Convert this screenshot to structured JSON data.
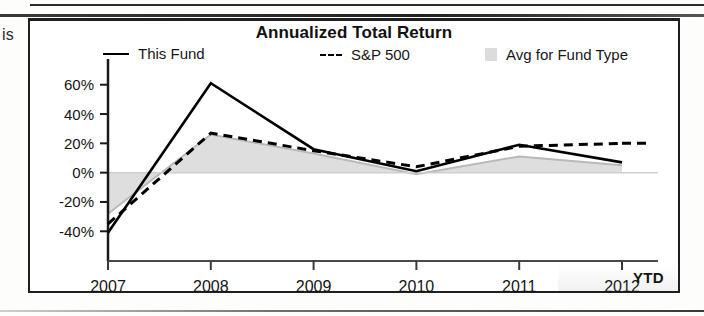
{
  "page": {
    "left_fragment_text": "is"
  },
  "chart": {
    "title": "Annualized Total Return",
    "legend": [
      {
        "key": "fund",
        "label": "This Fund",
        "marker": "solid-line",
        "color": "#000000"
      },
      {
        "key": "sp",
        "label": "S&P 500",
        "marker": "dashed-line",
        "color": "#000000"
      },
      {
        "key": "avg",
        "label": "Avg for Fund Type",
        "marker": "filled-area",
        "color": "#dcdcdc"
      }
    ],
    "axis_suffix_label": "YTD"
  },
  "chart_data": {
    "type": "line",
    "title": "Annualized Total Return",
    "xlabel": "",
    "ylabel": "",
    "categories": [
      "2007",
      "2008",
      "2009",
      "2010",
      "2011",
      "2012"
    ],
    "x_tick_labels": [
      "2007",
      "2008",
      "2009",
      "2010",
      "2011",
      "2012"
    ],
    "x_axis_note": "YTD",
    "y_tick_labels": [
      "60%",
      "40%",
      "20%",
      "0%",
      "-20%",
      "-40%"
    ],
    "y_ticks": [
      60,
      40,
      20,
      0,
      -20,
      -40
    ],
    "ylim": [
      -48,
      68
    ],
    "y_unit": "%",
    "grid": false,
    "legend_position": "top",
    "series": [
      {
        "name": "This Fund",
        "style": "solid",
        "color": "#000000",
        "values": [
          -41,
          61,
          16,
          1,
          19,
          7
        ]
      },
      {
        "name": "S&P 500",
        "style": "dashed",
        "color": "#000000",
        "values": [
          -35,
          27,
          15,
          4,
          18,
          20
        ]
      },
      {
        "name": "Avg for Fund Type",
        "style": "area",
        "color": "#dcdcdc",
        "values": [
          -28,
          26,
          13,
          -1,
          11,
          5
        ]
      }
    ]
  }
}
